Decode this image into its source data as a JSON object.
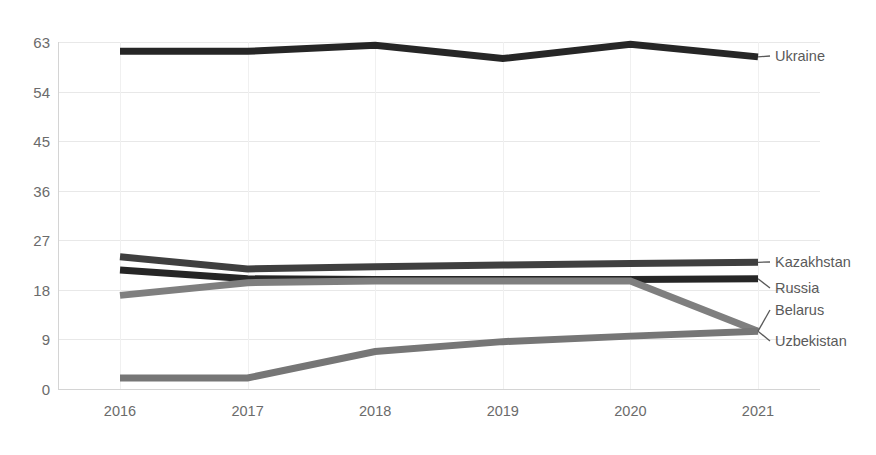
{
  "chart_data": {
    "type": "line",
    "title": "",
    "xlabel": "",
    "ylabel": "",
    "categories": [
      "2016",
      "2017",
      "2018",
      "2019",
      "2020",
      "2021"
    ],
    "x_tick_labels": [
      "2016",
      "2017",
      "2018",
      "2019",
      "2020",
      "2021"
    ],
    "y_tick_labels": [
      "0",
      "9",
      "18",
      "27",
      "36",
      "45",
      "54",
      "63"
    ],
    "y_ticks": [
      0,
      9,
      18,
      27,
      36,
      45,
      54,
      63
    ],
    "ylim": [
      0,
      63
    ],
    "grid": "horizontal-and-vertical",
    "legend_position": "right-of-plot-end-labels",
    "series": [
      {
        "name": "Ukraine",
        "color": "#262626",
        "values": [
          61.3,
          61.3,
          62.4,
          60.0,
          62.6,
          60.3
        ]
      },
      {
        "name": "Kazakhstan",
        "color": "#3f3f3f",
        "values": [
          24.0,
          21.8,
          22.2,
          22.5,
          22.8,
          23.0
        ]
      },
      {
        "name": "Russia",
        "color": "#262626",
        "values": [
          21.6,
          20.0,
          19.9,
          19.9,
          19.9,
          20.0
        ]
      },
      {
        "name": "Belarus",
        "color": "#7f7f7f",
        "values": [
          17.0,
          19.3,
          19.6,
          19.6,
          19.6,
          10.5
        ]
      },
      {
        "name": "Uzbekistan",
        "color": "#767676",
        "values": [
          2.0,
          2.0,
          6.8,
          8.6,
          9.6,
          10.5
        ]
      }
    ]
  },
  "axis": {
    "y_labels": [
      "63",
      "54",
      "45",
      "36",
      "27",
      "18",
      "9",
      "0"
    ],
    "x_labels": [
      "2016",
      "2017",
      "2018",
      "2019",
      "2020",
      "2021"
    ]
  },
  "series_labels": [
    {
      "name": "Ukraine",
      "text": "Ukraine"
    },
    {
      "name": "Kazakhstan",
      "text": "Kazakhstan"
    },
    {
      "name": "Russia",
      "text": "Russia"
    },
    {
      "name": "Belarus",
      "text": "Belarus"
    },
    {
      "name": "Uzbekistan",
      "text": "Uzbekistan"
    }
  ],
  "colors": {
    "ukraine": "#262626",
    "kazakhstan": "#3f3f3f",
    "russia": "#262626",
    "belarus": "#7f7f7f",
    "uzbekistan": "#767676",
    "grid": "#e8e8e8",
    "axis": "#d4d4d4",
    "text": "#6b6b6b"
  }
}
